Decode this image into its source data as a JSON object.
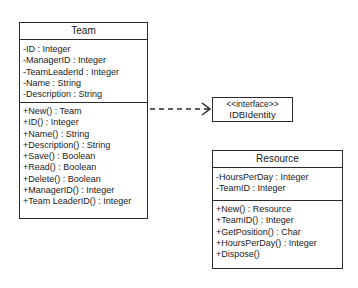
{
  "diagram": {
    "type": "uml-class-diagram",
    "classes": [
      {
        "id": "team",
        "name": "Team",
        "attributes": [
          "-ID : Integer",
          "-ManagerID : Integer",
          "-TeamLeaderId : Integer",
          "-Name : String",
          "-Description : String"
        ],
        "methods": [
          "+New() : Team",
          "+ID() : Integer",
          "+Name() : String",
          "+Description() : String",
          "+Save() : Boolean",
          "+Read() : Boolean",
          "+Delete() : Boolean",
          "+ManagerID() : Integer",
          "+Team LeaderID() : Integer"
        ]
      },
      {
        "id": "resource",
        "name": "Resource",
        "attributes": [
          "-HoursPerDay : Integer",
          "-TeamID : Integer"
        ],
        "methods": [
          "+New() : Resource",
          "+TeamID() : Integer",
          "+GetPosition() : Char",
          "+HoursPerDay() : Integer",
          "+Dispose()"
        ]
      }
    ],
    "interface": {
      "stereotype": "<<interface>>",
      "name": "IDBIdentity"
    },
    "relationships": [
      {
        "from": "Team",
        "to": "IDBIdentity",
        "style": "dashed",
        "arrowhead": "open"
      }
    ]
  }
}
